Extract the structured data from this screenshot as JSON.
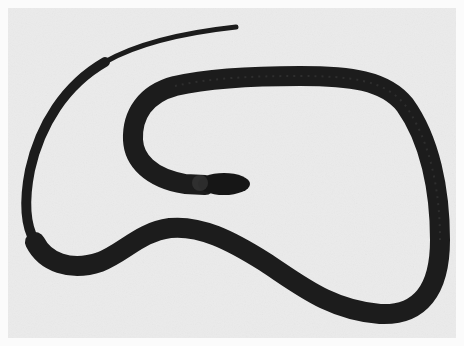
{
  "image": {
    "subject": "dark snake coiled on light background",
    "style": "grayscale photograph",
    "colors": {
      "background": "#ebebeb",
      "border": "#fbfbfb",
      "snake_body": "#1c1c1c",
      "snake_highlight": "#3a3a3a"
    }
  }
}
